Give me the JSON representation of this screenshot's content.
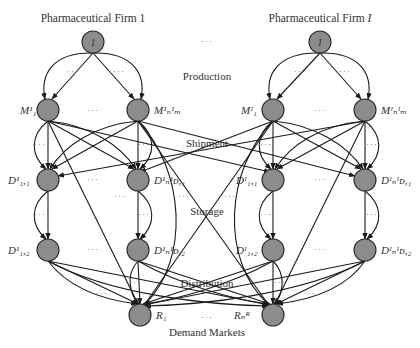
{
  "diagram": {
    "type": "supply-chain-network",
    "firms": [
      {
        "id": "firm-1",
        "title": "Pharmaceutical Firm 1",
        "node_label": "1"
      },
      {
        "id": "firm-I",
        "title": "Pharmaceutical Firm I",
        "node_label": "I"
      }
    ],
    "stages": {
      "production": "Production",
      "shipment": "Shipment",
      "storage": "Storage",
      "distribution": "Distribution",
      "demand_markets": "Demand Markets"
    },
    "ellipsis": "···",
    "nodes": {
      "firm1_M_first": "M¹₁",
      "firm1_M_last": "M¹ₙ¹ₘ",
      "firmI_M_first": "Mᴵ₁",
      "firmI_M_last": "Mᴵₙᴵₘ",
      "firm1_D1_first": "D¹₁,₁",
      "firm1_D1_last": "D¹ₙ¹ᴅ,₁",
      "firmI_D1_first": "Dᴵ₁,₁",
      "firmI_D1_last": "Dᴵₙᴵᴅ,₁",
      "firm1_D2_first": "D¹₁,₂",
      "firm1_D2_last": "D¹ₙ¹ᴅ,₂",
      "firmI_D2_first": "Dᴵ₁,₂",
      "firmI_D2_last": "Dᴵₙᴵᴅ,₂",
      "R_first": "R₁",
      "R_last": "Rₙᴿ"
    },
    "colors": {
      "node_fill": "#8c8c8c",
      "node_stroke": "#2a2a2a",
      "edge": "#1a1a1a",
      "text": "#333333"
    }
  }
}
